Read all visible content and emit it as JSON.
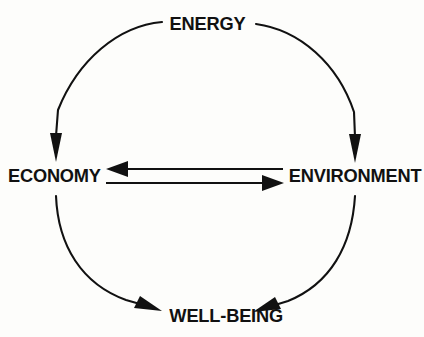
{
  "diagram": {
    "type": "cycle-diagram",
    "background_color": "#fdfdfb",
    "stroke_color": "#111111",
    "text_color": "#111111",
    "nodes": [
      {
        "id": "energy",
        "label": "ENERGY",
        "position": "top"
      },
      {
        "id": "economy",
        "label": "ECONOMY",
        "position": "left"
      },
      {
        "id": "environment",
        "label": "ENVIRONMENT",
        "position": "right"
      },
      {
        "id": "wellbeing",
        "label": "WELL-BEING",
        "position": "bottom"
      }
    ],
    "edges": [
      {
        "id": "energy-to-economy",
        "from": "ENERGY",
        "to": "ECONOMY",
        "shape": "arc",
        "direction": "counterclockwise",
        "arrowhead": "end"
      },
      {
        "id": "energy-to-environment",
        "from": "ENERGY",
        "to": "ENVIRONMENT",
        "shape": "arc",
        "direction": "clockwise",
        "arrowhead": "end"
      },
      {
        "id": "economy-to-wellbeing",
        "from": "ECONOMY",
        "to": "WELL-BEING",
        "shape": "arc",
        "direction": "counterclockwise",
        "arrowhead": "end"
      },
      {
        "id": "environment-to-wellbeing",
        "from": "ENVIRONMENT",
        "to": "WELL-BEING",
        "shape": "arc",
        "direction": "clockwise",
        "arrowhead": "end"
      },
      {
        "id": "environment-to-economy",
        "from": "ENVIRONMENT",
        "to": "ECONOMY",
        "shape": "straight",
        "direction": "left",
        "arrowhead": "end"
      },
      {
        "id": "economy-to-environment",
        "from": "ECONOMY",
        "to": "ENVIRONMENT",
        "shape": "straight",
        "direction": "right",
        "arrowhead": "end"
      }
    ]
  }
}
